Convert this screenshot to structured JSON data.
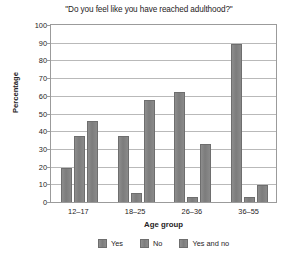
{
  "chart_data": {
    "type": "bar",
    "title": "\"Do you feel like you have reached adulthood?\"",
    "xlabel": "Age group",
    "ylabel": "Percentage",
    "categories": [
      "12–17",
      "18–25",
      "26–36",
      "36–55"
    ],
    "series": [
      {
        "name": "Yes",
        "values": [
          19.5,
          37.5,
          62,
          89
        ]
      },
      {
        "name": "No",
        "values": [
          37.5,
          5,
          3,
          3
        ]
      },
      {
        "name": "Yes and no",
        "values": [
          46,
          57.5,
          32.5,
          9.5
        ]
      }
    ],
    "ylim": [
      0,
      100
    ],
    "yticks": [
      100,
      90,
      80,
      70,
      60,
      50,
      40,
      30,
      20,
      10,
      0
    ],
    "grid": "horizontal",
    "legend_position": "bottom",
    "bar_color": "#808080",
    "border_color": "#6e6e6e",
    "grid_color": "#b9b9b9",
    "text_color": "#262324"
  }
}
